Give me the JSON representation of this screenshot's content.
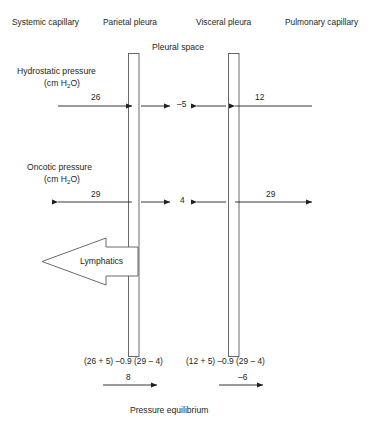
{
  "figure": {
    "type": "physiology-diagram",
    "headers": [
      {
        "id": "systemic-capillary",
        "label": "Systemic capillary",
        "x": 12,
        "y": 22
      },
      {
        "id": "parietal-pleura",
        "label": "Parietal pleura",
        "x": 103,
        "y": 22
      },
      {
        "id": "visceral-pleura",
        "label": "Visceral pleura",
        "x": 196,
        "y": 22
      },
      {
        "id": "pulmonary-capillary",
        "label": "Pulmonary capillary",
        "x": 285,
        "y": 22
      }
    ],
    "pleural_space_label": "Pleural space",
    "sections": [
      {
        "id": "hydrostatic",
        "title": "Hydrostatic pressure",
        "units": "(cm H",
        "units_sub": "2",
        "units_tail": "O)",
        "center_value": "–5",
        "left_value": "26",
        "right_value": "12",
        "left_arrow_direction": "right",
        "right_arrow_direction": "left",
        "inner_left_arrow_direction": "right",
        "inner_right_arrow_direction": "left"
      },
      {
        "id": "oncotic",
        "title": "Oncotic pressure",
        "units": "(cm H",
        "units_sub": "2",
        "units_tail": "O)",
        "center_value": "4",
        "left_value": "29",
        "right_value": "29",
        "left_arrow_direction": "left",
        "right_arrow_direction": "right",
        "inner_left_arrow_direction": "right",
        "inner_right_arrow_direction": "left"
      }
    ],
    "lymphatics_label": "Lymphatics",
    "equations": [
      {
        "id": "parietal-equation",
        "text": "(26 + 5) –0.9 (29 – 4)"
      },
      {
        "id": "visceral-equation",
        "text": "(12 + 5) –0.9 (29 – 4)"
      }
    ],
    "net_values": [
      {
        "id": "parietal-net",
        "value": "8",
        "direction": "right"
      },
      {
        "id": "visceral-net",
        "value": "–6",
        "direction": "right"
      }
    ],
    "footer_label": "Pressure equilibrium",
    "colors": {
      "ink": "#231f20",
      "line": "#231f20",
      "membrane_stroke": "#58595b",
      "background": "#ffffff"
    }
  }
}
